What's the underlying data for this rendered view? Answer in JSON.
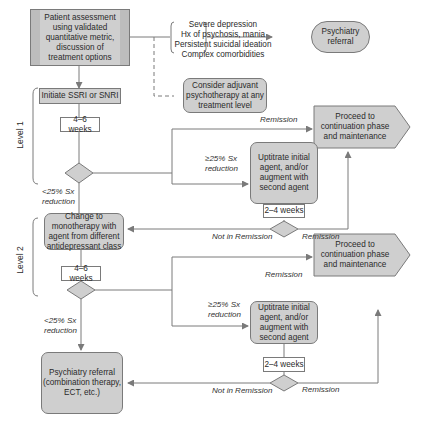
{
  "diagram": {
    "type": "flowchart",
    "nodes": {
      "assessment": "Patient assessment using validated quantitative metric, discussion of treatment options",
      "risk_factors": [
        "Severe depression",
        "Hx of psychosis, mania",
        "Persistent suicidal ideation",
        "Complex comorbidities"
      ],
      "psychiatry_referral_top": "Psychiatry referral",
      "adjuvant_psychotherapy": "Consider adjuvant psychotherapy at any treatment level",
      "initiate": "Initiate SSRI or SNRI",
      "wait_l1": "4–6 weeks",
      "uptitrate_l1": "Uptitrate initial agent, and/or augment with second agent",
      "wait2_l1": "2–4 weeks",
      "proceed_l1": "Proceed to continuation phase and maintenance",
      "change_mono": "Change to monotherapy with agent from different antidepressant class",
      "wait_l2": "4–6 weeks",
      "uptitrate_l2": "Uptitrate initial agent, and/or augment with second agent",
      "wait2_l2": "2–4 weeks",
      "proceed_l2": "Proceed to continuation phase and maintenance",
      "psychiatry_referral_bottom": "Psychiatry referral (combination therapy, ECT, etc.)"
    },
    "edge_labels": {
      "remission": "Remission",
      "not_in_remission": "Not in Remission",
      "ge25": "≥25% Sx reduction",
      "lt25": "<25% Sx reduction"
    },
    "levels": [
      "Level 1",
      "Level 2"
    ],
    "colors": {
      "box_fill": "#cfcfcf",
      "stroke": "#7a7a7a",
      "text": "#2a2a2a"
    }
  }
}
